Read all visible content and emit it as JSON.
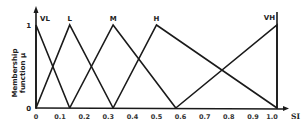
{
  "chart_data": {
    "type": "line",
    "title": "",
    "xlabel": "SI",
    "ylabel": "Membership function μ",
    "ylabel_lines": [
      "Membership",
      "function μ"
    ],
    "xlim": [
      0,
      1.0
    ],
    "ylim": [
      0,
      1
    ],
    "grid": false,
    "legend": "none (series labeled at peaks)",
    "x_ticks": [
      "0",
      "0.1",
      "0.2",
      "0.3",
      "0.4",
      "0.5",
      "0.6",
      "0.7",
      "0.8",
      "0.9",
      "1.0"
    ],
    "y_ticks": [
      "0",
      "1"
    ],
    "series": [
      {
        "name": "VL",
        "x": [
          0,
          0,
          0.14
        ],
        "y": [
          0,
          1,
          0
        ]
      },
      {
        "name": "L",
        "x": [
          0,
          0.14,
          0.32
        ],
        "y": [
          0,
          1,
          0
        ]
      },
      {
        "name": "M",
        "x": [
          0.14,
          0.32,
          0.58
        ],
        "y": [
          0,
          1,
          0
        ]
      },
      {
        "name": "H",
        "x": [
          0.32,
          0.5,
          1.0
        ],
        "y": [
          0,
          1,
          0
        ]
      },
      {
        "name": "VH",
        "x": [
          0.58,
          1.0,
          1.0
        ],
        "y": [
          0,
          1,
          0
        ]
      }
    ],
    "line_color": "#1a1a1a"
  }
}
